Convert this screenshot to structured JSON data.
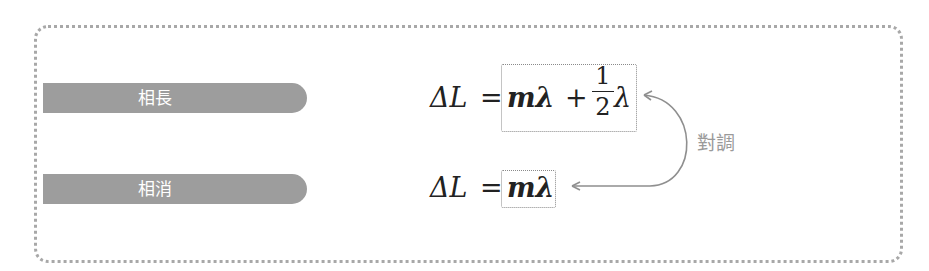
{
  "labels": {
    "constructive": "相長",
    "destructive": "相消"
  },
  "equations": {
    "constructive": {
      "lhs": "ΔL",
      "equals": "=",
      "term1": "mλ",
      "plus": "+",
      "frac_num": "1",
      "frac_den": "2",
      "term2": "λ"
    },
    "destructive": {
      "lhs": "ΔL",
      "equals": "=",
      "term1": "mλ"
    }
  },
  "swap_label": "對調",
  "colors": {
    "pill": "#9d9d9d",
    "frame": "#a8a8a8",
    "arrow": "#8f8f8f",
    "swap_text": "#9a9a9a"
  }
}
